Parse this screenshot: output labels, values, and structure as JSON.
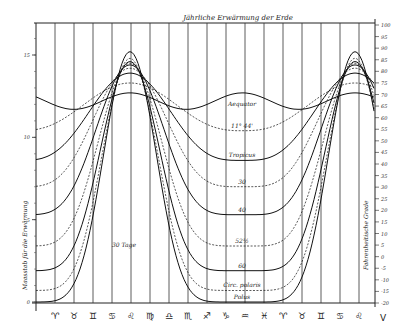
{
  "chart_data": {
    "type": "line",
    "title": "Jährliche Erwärmung der Erde",
    "xlabel": "Zodiac months (30 Tage per division)",
    "ylabel_left": "Maasstab für die Erwärmung",
    "ylabel_right": "Fahrenheitische Grade",
    "annotation": "30 Tage",
    "x_ticks": [
      "♈",
      "♉",
      "♊",
      "♋",
      "♌",
      "♍",
      "♎",
      "♏",
      "♐",
      "♑",
      "♒",
      "♓",
      "♈",
      "♉",
      "♊",
      "♋",
      "♌"
    ],
    "x_end_label": "V",
    "left_ticks": [
      "15",
      "10",
      "5",
      "0"
    ],
    "left_tick_values": [
      15,
      10,
      5,
      0
    ],
    "right_ticks": [
      "100",
      "95",
      "90",
      "85",
      "80",
      "75",
      "70",
      "65",
      "60",
      "55",
      "50",
      "45",
      "40",
      "35",
      "30",
      "25",
      "20",
      "15",
      "10",
      "5",
      "0",
      "-5",
      "-10",
      "-15",
      "-20"
    ],
    "ylim_left": [
      0,
      17
    ],
    "grid": true,
    "series": [
      {
        "name": "Aequator",
        "style": "solid",
        "peak": 12.7,
        "trough": 11.7
      },
      {
        "name": "11° 44'",
        "style": "dashed",
        "peak": 13.3,
        "trough": 10.4
      },
      {
        "name": "Tropicus",
        "style": "solid",
        "peak": 13.9,
        "trough": 8.6
      },
      {
        "name": "30",
        "style": "dashed",
        "peak": 14.2,
        "trough": 7.0
      },
      {
        "name": "40",
        "style": "solid",
        "peak": 14.4,
        "trough": 5.3
      },
      {
        "name": "52½",
        "style": "dashed",
        "peak": 14.5,
        "trough": 3.4
      },
      {
        "name": "60",
        "style": "solid",
        "peak": 14.6,
        "trough": 1.9
      },
      {
        "name": "Circ. polaris",
        "style": "dashed",
        "peak": 14.8,
        "trough": 0.7
      },
      {
        "name": "Polus",
        "style": "solid",
        "peak": 15.2,
        "trough": 0.0
      }
    ]
  },
  "labels": {
    "title": "Jährliche Erwärmung der Erde",
    "left_axis": "Maasstab für die Erwärmung",
    "right_axis": "Fahrenheitische Grade",
    "days": "30 Tage",
    "end": "V"
  }
}
